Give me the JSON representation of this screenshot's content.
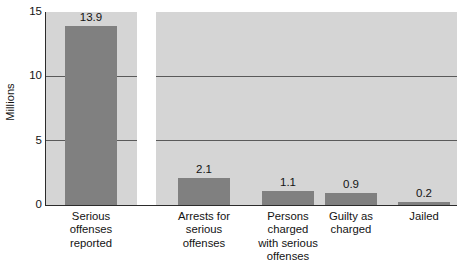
{
  "chart_data": {
    "type": "bar",
    "title": "",
    "subtitle": "",
    "xlabel": "",
    "ylabel": "Millions",
    "ylim": [
      0,
      15
    ],
    "yticks": [
      0,
      5,
      10,
      15
    ],
    "ytick_labels": [
      "0",
      "5",
      "10",
      "15"
    ],
    "grid": true,
    "gridlines_at": [
      5,
      10,
      15
    ],
    "legend": "none",
    "categories": [
      "Serious offenses reported",
      "Arrests for serious offenses",
      "Persons charged with serious offenses",
      "Guilty as charged",
      "Jailed"
    ],
    "values": [
      13.9,
      2.1,
      1.1,
      0.9,
      0.2
    ],
    "value_labels": [
      "13.9",
      "2.1",
      "1.1",
      "0.9",
      "0.2"
    ],
    "bars": [
      {
        "category_lines": [
          "Serious",
          "offenses",
          "reported"
        ],
        "value": 13.9,
        "value_label": "13.9",
        "panel": "left",
        "x": 65,
        "width": 52
      },
      {
        "category_lines": [
          "Arrests for",
          "serious",
          "offenses"
        ],
        "value": 2.1,
        "value_label": "2.1",
        "panel": "right",
        "x": 178,
        "width": 52
      },
      {
        "category_lines": [
          "Persons",
          "charged",
          "with serious",
          "offenses"
        ],
        "value": 1.1,
        "value_label": "1.1",
        "panel": "right",
        "x": 262,
        "width": 52
      },
      {
        "category_lines": [
          "Guilty as",
          "charged"
        ],
        "value": 0.9,
        "value_label": "0.9",
        "panel": "right",
        "x": 325,
        "width": 52
      },
      {
        "category_lines": [
          "Jailed"
        ],
        "value": 0.2,
        "value_label": "0.2",
        "panel": "right",
        "x": 398,
        "width": 52
      }
    ],
    "colors": {
      "bar": "#808080",
      "panel_background": "#d5d5d5",
      "gridline": "#5a5a5a",
      "axis": "#2b2b2b",
      "page_background": "#ffffff",
      "text": "#131313"
    }
  }
}
